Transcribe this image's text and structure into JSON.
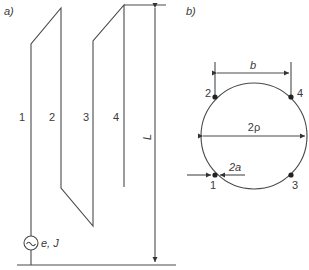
{
  "panel_a": {
    "label": "a)",
    "wire_labels": [
      "1",
      "2",
      "3",
      "4"
    ],
    "length_label": "L",
    "source_label": "e, J",
    "source_symbol": "~"
  },
  "panel_b": {
    "label": "b)",
    "spacing_label": "b",
    "diameter_label": "2ρ",
    "wire_diameter_label": "2a",
    "point_labels": [
      "1",
      "2",
      "3",
      "4"
    ]
  },
  "colors": {
    "line": "#4a4a4a",
    "text": "#3a3a3a",
    "background": "#ffffff"
  }
}
